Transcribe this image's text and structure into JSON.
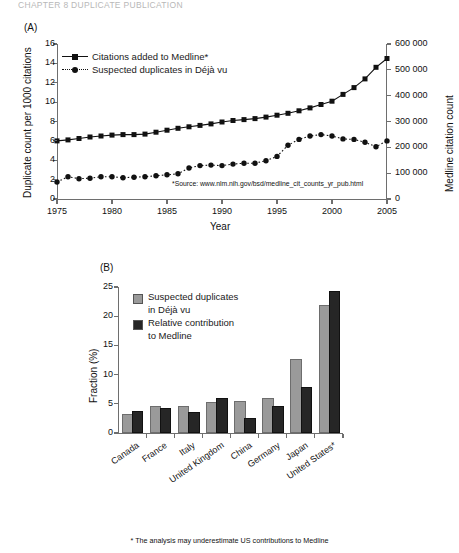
{
  "page_header": "CHAPTER 8 DUPLICATE PUBLICATION",
  "panel_a": {
    "tag": "(A)"
  },
  "panel_b": {
    "tag": "(B)"
  },
  "footnote": "* The analysis may underestimate US contributions to Medline",
  "chart_data": [
    {
      "type": "line",
      "panel": "(A)",
      "title": "",
      "xlabel": "Year",
      "ylabel": "Duplicate count per 1000 citations",
      "y2label": "Medline citation count",
      "xlim": [
        1975,
        2005
      ],
      "ylim": [
        0,
        16
      ],
      "y2lim": [
        0,
        600000
      ],
      "xticks": [
        1975,
        1980,
        1985,
        1990,
        1995,
        2000,
        2005
      ],
      "yticks": [
        0,
        2,
        4,
        6,
        8,
        10,
        12,
        14,
        16
      ],
      "y2ticks": [
        0,
        100000,
        200000,
        300000,
        400000,
        500000,
        600000
      ],
      "grid": false,
      "legend_position": "upper-left",
      "annotation": "*Source: www.nlm.nih.gov/bsd/medline_cit_counts_yr_pub.html",
      "x": [
        1975,
        1976,
        1977,
        1978,
        1979,
        1980,
        1981,
        1982,
        1983,
        1984,
        1985,
        1986,
        1987,
        1988,
        1989,
        1990,
        1991,
        1992,
        1993,
        1994,
        1995,
        1996,
        1997,
        1998,
        1999,
        2000,
        2001,
        2002,
        2003,
        2004,
        2005
      ],
      "series": [
        {
          "name": "Citations added to Medline*",
          "axis": "right",
          "marker": "square",
          "line": "solid",
          "values": [
            6.0,
            6.1,
            6.25,
            6.4,
            6.5,
            6.6,
            6.65,
            6.65,
            6.7,
            6.9,
            7.1,
            7.3,
            7.45,
            7.6,
            7.75,
            7.95,
            8.1,
            8.2,
            8.3,
            8.45,
            8.65,
            8.85,
            9.1,
            9.4,
            9.75,
            10.1,
            10.8,
            11.5,
            12.4,
            13.6,
            14.5
          ]
        },
        {
          "name": "Suspected duplicates in Déjà vu",
          "axis": "left",
          "marker": "circle",
          "line": "dotted",
          "values": [
            1.75,
            2.3,
            2.1,
            2.15,
            2.3,
            2.3,
            2.2,
            2.25,
            2.3,
            2.4,
            2.5,
            2.6,
            3.2,
            3.45,
            3.5,
            3.45,
            3.6,
            3.7,
            3.7,
            3.95,
            4.4,
            5.55,
            6.15,
            6.5,
            6.65,
            6.5,
            6.2,
            6.15,
            5.85,
            5.4,
            6.0
          ]
        }
      ],
      "series_note": "left-axis values; right axis maps 0-600000 onto the same 0-16 frame"
    },
    {
      "type": "bar",
      "panel": "(B)",
      "title": "",
      "xlabel": "",
      "ylabel": "Fraction (%)",
      "ylim": [
        0,
        25
      ],
      "yticks": [
        0,
        5,
        10,
        15,
        20,
        25
      ],
      "grid": false,
      "legend_position": "upper-left",
      "categories": [
        "Canada",
        "France",
        "Italy",
        "United Kingdom",
        "China",
        "Germany",
        "Japan",
        "United States*"
      ],
      "series": [
        {
          "name": "Suspected duplicates in Déjà vu",
          "color": "#9a9a9a",
          "values": [
            2.9,
            4.2,
            4.2,
            5.0,
            5.2,
            5.6,
            12.4,
            21.5
          ]
        },
        {
          "name": "Relative contribution to Medline",
          "color": "#262626",
          "values": [
            3.4,
            3.9,
            3.3,
            5.6,
            2.2,
            4.3,
            7.5,
            24.0
          ]
        }
      ]
    }
  ]
}
